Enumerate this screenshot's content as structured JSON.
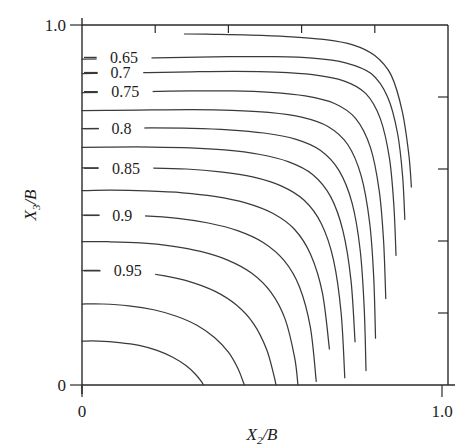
{
  "figure": {
    "type": "contour-plot",
    "background": "#ffffff",
    "line_color": "#3a3a3a",
    "axis_color": "#2a2a2a"
  },
  "axes": {
    "x": {
      "label_main": "X",
      "label_sub": "2",
      "label_tail": "/B",
      "full_label": "X2/B",
      "min_tick_label": "0",
      "max_tick_label": "1.0",
      "range": [
        0,
        1
      ],
      "tick_values": [
        0,
        0.2,
        0.4,
        0.6,
        0.8,
        1.0
      ],
      "labeled_ticks": [
        "0",
        "1.0"
      ]
    },
    "y": {
      "label_main": "X",
      "label_sub": "3",
      "label_tail": "/B",
      "full_label": "X3/B",
      "min_tick_label": "0",
      "max_tick_label": "1.0",
      "range": [
        0,
        1
      ],
      "tick_values": [
        0,
        0.2,
        0.4,
        0.6,
        0.8,
        1.0
      ],
      "labeled_ticks": [
        "0",
        "1.0"
      ]
    }
  },
  "chart_data": {
    "type": "line",
    "title": "",
    "xlabel": "X2/B",
    "ylabel": "X3/B",
    "xlim": [
      0,
      1
    ],
    "ylim": [
      0,
      1
    ],
    "grid": false,
    "legend": "none",
    "annotations": [
      "0.65",
      "0.7",
      "0.75",
      "0.8",
      "0.85",
      "0.9",
      "0.95"
    ],
    "contour_levels": [
      0.65,
      0.7,
      0.75,
      0.8,
      0.85,
      0.9,
      0.95
    ],
    "series": [
      {
        "name": "0.60",
        "labeled": false,
        "label_text": "",
        "x": [
          0.28,
          0.36,
          0.46,
          0.56,
          0.66,
          0.74,
          0.8,
          0.845,
          0.875,
          0.893,
          0.9
        ],
        "y": [
          0.975,
          0.974,
          0.972,
          0.968,
          0.96,
          0.945,
          0.915,
          0.86,
          0.76,
          0.64,
          0.55
        ]
      },
      {
        "name": "0.65",
        "labeled": true,
        "label_text": "0.65",
        "x": [
          0.0,
          0.06,
          0.16,
          0.28,
          0.4,
          0.52,
          0.63,
          0.72,
          0.79,
          0.835,
          0.862,
          0.876,
          0.882
        ],
        "y": [
          0.905,
          0.906,
          0.908,
          0.91,
          0.912,
          0.912,
          0.908,
          0.895,
          0.865,
          0.8,
          0.7,
          0.58,
          0.46
        ]
      },
      {
        "name": "0.70",
        "labeled": true,
        "label_text": "0.7",
        "x": [
          0.0,
          0.07,
          0.18,
          0.3,
          0.42,
          0.53,
          0.63,
          0.715,
          0.775,
          0.815,
          0.84,
          0.852,
          0.858
        ],
        "y": [
          0.865,
          0.866,
          0.868,
          0.87,
          0.871,
          0.869,
          0.862,
          0.845,
          0.81,
          0.74,
          0.63,
          0.5,
          0.36
        ]
      },
      {
        "name": "0.75",
        "labeled": true,
        "label_text": "0.75",
        "x": [
          0.0,
          0.07,
          0.18,
          0.3,
          0.41,
          0.515,
          0.61,
          0.69,
          0.748,
          0.788,
          0.812,
          0.824,
          0.83
        ],
        "y": [
          0.812,
          0.813,
          0.815,
          0.817,
          0.817,
          0.813,
          0.803,
          0.782,
          0.74,
          0.66,
          0.54,
          0.4,
          0.24
        ]
      },
      {
        "name": "0.78",
        "labeled": false,
        "label_text": "",
        "x": [
          0.0,
          0.08,
          0.19,
          0.3,
          0.41,
          0.51,
          0.6,
          0.672,
          0.726,
          0.763,
          0.786,
          0.797,
          0.802
        ],
        "y": [
          0.762,
          0.763,
          0.764,
          0.765,
          0.763,
          0.757,
          0.744,
          0.718,
          0.668,
          0.58,
          0.45,
          0.3,
          0.13
        ]
      },
      {
        "name": "0.80",
        "labeled": true,
        "label_text": "0.8",
        "x": [
          0.0,
          0.08,
          0.19,
          0.3,
          0.4,
          0.497,
          0.583,
          0.651,
          0.702,
          0.738,
          0.76,
          0.771,
          0.776
        ],
        "y": [
          0.712,
          0.713,
          0.714,
          0.713,
          0.709,
          0.7,
          0.683,
          0.652,
          0.596,
          0.505,
          0.375,
          0.215,
          0.04
        ]
      },
      {
        "name": "0.82",
        "labeled": false,
        "label_text": "",
        "x": [
          0.0,
          0.08,
          0.19,
          0.295,
          0.39,
          0.483,
          0.565,
          0.63,
          0.679,
          0.713,
          0.735,
          0.746
        ],
        "y": [
          0.66,
          0.661,
          0.661,
          0.659,
          0.653,
          0.641,
          0.62,
          0.585,
          0.524,
          0.428,
          0.29,
          0.12
        ]
      },
      {
        "name": "0.85",
        "labeled": true,
        "label_text": "0.85",
        "x": [
          0.0,
          0.08,
          0.18,
          0.285,
          0.378,
          0.466,
          0.544,
          0.607,
          0.654,
          0.687,
          0.708,
          0.718
        ],
        "y": [
          0.603,
          0.604,
          0.603,
          0.6,
          0.592,
          0.578,
          0.553,
          0.513,
          0.448,
          0.348,
          0.2,
          0.02
        ]
      },
      {
        "name": "0.87",
        "labeled": false,
        "label_text": "",
        "x": [
          0.0,
          0.08,
          0.175,
          0.275,
          0.362,
          0.447,
          0.521,
          0.581,
          0.625,
          0.657,
          0.676
        ],
        "y": [
          0.54,
          0.541,
          0.539,
          0.534,
          0.524,
          0.506,
          0.477,
          0.432,
          0.362,
          0.255,
          0.1
        ]
      },
      {
        "name": "0.90",
        "labeled": true,
        "label_text": "0.9",
        "x": [
          0.0,
          0.075,
          0.17,
          0.262,
          0.345,
          0.425,
          0.495,
          0.552,
          0.594,
          0.624,
          0.64
        ],
        "y": [
          0.472,
          0.472,
          0.47,
          0.463,
          0.45,
          0.429,
          0.396,
          0.346,
          0.273,
          0.16,
          0.01
        ]
      },
      {
        "name": "0.92",
        "labeled": false,
        "label_text": "",
        "x": [
          0.0,
          0.07,
          0.16,
          0.246,
          0.324,
          0.398,
          0.463,
          0.516,
          0.555,
          0.581,
          0.59
        ],
        "y": [
          0.398,
          0.398,
          0.395,
          0.386,
          0.371,
          0.347,
          0.311,
          0.258,
          0.183,
          0.076,
          0.0
        ]
      },
      {
        "name": "0.95",
        "labeled": true,
        "label_text": "0.95",
        "x": [
          0.0,
          0.065,
          0.148,
          0.226,
          0.298,
          0.364,
          0.422,
          0.469,
          0.504,
          0.524,
          0.53
        ],
        "y": [
          0.318,
          0.318,
          0.314,
          0.303,
          0.286,
          0.26,
          0.222,
          0.17,
          0.1,
          0.028,
          0.0
        ]
      },
      {
        "name": "0.97",
        "labeled": false,
        "label_text": "",
        "x": [
          0.0,
          0.056,
          0.128,
          0.196,
          0.258,
          0.314,
          0.362,
          0.4,
          0.426,
          0.44,
          0.444
        ],
        "y": [
          0.225,
          0.225,
          0.22,
          0.209,
          0.191,
          0.166,
          0.132,
          0.091,
          0.046,
          0.01,
          0.0
        ]
      },
      {
        "name": "0.99",
        "labeled": false,
        "label_text": "",
        "x": [
          0.0,
          0.045,
          0.102,
          0.156,
          0.205,
          0.248,
          0.284,
          0.31,
          0.326,
          0.332
        ],
        "y": [
          0.122,
          0.122,
          0.118,
          0.11,
          0.096,
          0.077,
          0.054,
          0.03,
          0.01,
          0.0
        ]
      }
    ]
  },
  "contour_labels": [
    {
      "text": "0.65",
      "x": 0.115,
      "y": 0.91
    },
    {
      "text": "0.7",
      "x": 0.105,
      "y": 0.868
    },
    {
      "text": "0.75",
      "x": 0.118,
      "y": 0.815
    },
    {
      "text": "0.8",
      "x": 0.108,
      "y": 0.712
    },
    {
      "text": "0.85",
      "x": 0.12,
      "y": 0.602
    },
    {
      "text": "0.9",
      "x": 0.11,
      "y": 0.471
    },
    {
      "text": "0.95",
      "x": 0.125,
      "y": 0.317
    }
  ]
}
